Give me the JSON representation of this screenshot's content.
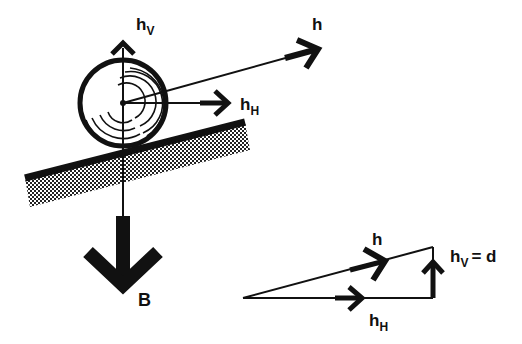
{
  "diagram": {
    "labels": {
      "h_top": "h",
      "h_v_main": "h",
      "h_v_main_sub": "V",
      "h_h_main": "h",
      "h_h_main_sub": "H",
      "weight": "B",
      "tri_h": "h",
      "tri_hv": "h",
      "tri_hv_sub": "V",
      "tri_hv_eq": "= d",
      "tri_hh": "h",
      "tri_hh_sub": "H"
    },
    "colors": {
      "ink": "#111111",
      "background": "#ffffff"
    }
  }
}
